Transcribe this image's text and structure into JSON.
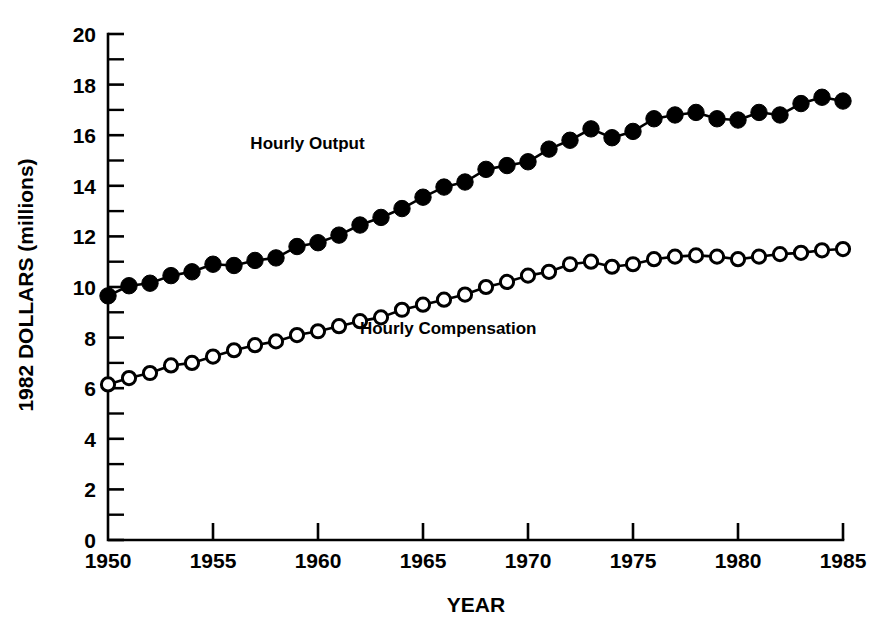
{
  "chart_data": {
    "type": "line",
    "title": "",
    "xlabel": "YEAR",
    "ylabel": "1982 DOLLARS (millions)",
    "xlim": [
      1950,
      1985
    ],
    "ylim": [
      0,
      20
    ],
    "xticks": [
      1950,
      1955,
      1960,
      1965,
      1970,
      1975,
      1980,
      1985
    ],
    "xtick_labels": [
      "1950",
      "1955",
      "1960",
      "1965",
      "1970",
      "1975",
      "1980",
      "1985"
    ],
    "yticks": [
      0,
      2,
      4,
      6,
      8,
      10,
      12,
      14,
      16,
      18,
      20
    ],
    "ytick_labels": [
      "0",
      "2",
      "4",
      "6",
      "8",
      "10",
      "12",
      "14",
      "16",
      "18",
      "20"
    ],
    "y_minor_tick_interval": 1,
    "grid": false,
    "legend": "inline-annotations",
    "x": [
      1950,
      1951,
      1952,
      1953,
      1954,
      1955,
      1956,
      1957,
      1958,
      1959,
      1960,
      1961,
      1962,
      1963,
      1964,
      1965,
      1966,
      1967,
      1968,
      1969,
      1970,
      1971,
      1972,
      1973,
      1974,
      1975,
      1976,
      1977,
      1978,
      1979,
      1980,
      1981,
      1982,
      1983,
      1984,
      1985
    ],
    "series": [
      {
        "name": "Hourly Output",
        "marker": "filled-circle",
        "annotation_x": 1959.5,
        "annotation_y": 15.45,
        "values": [
          9.65,
          10.05,
          10.15,
          10.45,
          10.6,
          10.9,
          10.85,
          11.05,
          11.15,
          11.6,
          11.75,
          12.05,
          12.45,
          12.75,
          13.1,
          13.55,
          13.95,
          14.15,
          14.65,
          14.8,
          14.95,
          15.45,
          15.8,
          16.25,
          15.9,
          16.15,
          16.65,
          16.8,
          16.9,
          16.65,
          16.6,
          16.9,
          16.8,
          17.25,
          17.5,
          17.35
        ]
      },
      {
        "name": "Hourly Compensation",
        "marker": "open-circle",
        "annotation_x": 1966.2,
        "annotation_y": 8.15,
        "values": [
          6.15,
          6.4,
          6.6,
          6.9,
          7.0,
          7.25,
          7.5,
          7.7,
          7.85,
          8.1,
          8.25,
          8.45,
          8.65,
          8.8,
          9.1,
          9.3,
          9.5,
          9.7,
          10.0,
          10.2,
          10.45,
          10.6,
          10.9,
          11.0,
          10.8,
          10.9,
          11.1,
          11.2,
          11.25,
          11.2,
          11.1,
          11.2,
          11.3,
          11.35,
          11.45,
          11.5
        ]
      }
    ]
  }
}
